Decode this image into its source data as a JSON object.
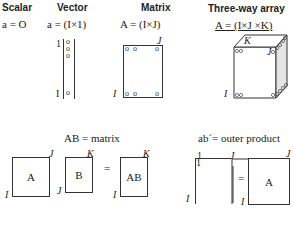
{
  "headers": {
    "scalar": "Scalar",
    "vector": "Vector",
    "matrix": "Matrix",
    "threeway": "Three-way array"
  },
  "equations": {
    "scalar": "a = O",
    "vector": "a = (I×1)",
    "matrix": "A = (I×J)",
    "threeway": "A = (I×J ×K)"
  },
  "vector": {
    "top_index": "1",
    "bottom_index": "I",
    "elements": [
      "o",
      "o",
      "o",
      "o"
    ]
  },
  "matrix": {
    "row_label": "I",
    "col_label": "J",
    "corner_elements": [
      "o o",
      "o",
      "o o",
      "o"
    ]
  },
  "cube": {
    "row_label": "I",
    "col_label": "J",
    "depth_label": "K"
  },
  "product": {
    "title": "AB = matrix",
    "a_label": "A",
    "b_label": "B",
    "ab_label": "AB",
    "equals": "=",
    "a_rows": "I",
    "a_cols": "J",
    "b_rows": "J",
    "b_cols": "K",
    "ab_rows": "I",
    "ab_cols": "K"
  },
  "outer": {
    "title": "ab´= outer product",
    "col_one": "1",
    "row_one": "1",
    "col_label": "J",
    "row_label": "I",
    "equals": "=",
    "result_label": "A",
    "result_rows": "I",
    "result_cols": "J"
  }
}
